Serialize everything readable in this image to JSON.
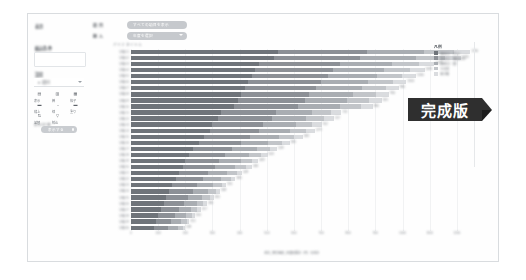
{
  "app": {
    "badge": "完成版"
  },
  "sidebar": {
    "labels": [
      "表示",
      "絞込条件",
      "設定"
    ],
    "select": {
      "value": "▾ 項目",
      "caret": "chevron-down-icon"
    },
    "icon_buttons": [
      {
        "name": "table-view-icon",
        "glyph": "▤",
        "caption": "表示"
      },
      {
        "name": "bar-chart-icon",
        "glyph": "▥",
        "caption": "棒"
      },
      {
        "name": "grid-icon",
        "glyph": "▦",
        "caption": "格子"
      },
      {
        "name": "stack-icon",
        "glyph": "▬",
        "caption": "積上"
      },
      {
        "name": "line-icon",
        "glyph": "⎯",
        "caption": "線"
      },
      {
        "name": "fill-icon",
        "glyph": "▬",
        "caption": "塗り"
      },
      {
        "name": "sort-asc-icon",
        "glyph": "⇅",
        "caption": "並替"
      },
      {
        "name": "filter-icon",
        "glyph": "▽",
        "caption": "絞込"
      }
    ],
    "switch_label": "表示切替",
    "switch_caption": "ラベル",
    "pill": {
      "label": "表示する",
      "toggle": "toggle-knob"
    }
  },
  "top_filters": [
    {
      "label": "項 目",
      "value": "すべての項目を表示",
      "caret": false
    },
    {
      "label": "期 入",
      "value": "年度を選択",
      "caret": true
    }
  ],
  "legend": {
    "title": "凡例",
    "items": [
      {
        "label": "第1区分（売上）",
        "color": "#6f747a"
      },
      {
        "label": "第2区分（構成比率）",
        "color": "#8c9096"
      },
      {
        "label": "第3区分（差）",
        "color": "#a9adb2"
      },
      {
        "label": "その他",
        "color": "#c2c5c9"
      },
      {
        "label": "未分類",
        "color": "#dadcdf"
      }
    ]
  },
  "chart_data": {
    "type": "bar",
    "orientation": "horizontal",
    "stacked": true,
    "title": "",
    "header_note": "グラフタイトル",
    "xlabel": "合計_取引金額_年度別累計（円）の合計",
    "ylabel": "",
    "xlim": [
      0,
      1300
    ],
    "xticks": [
      0,
      100,
      200,
      300,
      400,
      500,
      600,
      700,
      800,
      900,
      1000,
      1100,
      1200
    ],
    "grid": true,
    "legend_position": "right",
    "categories": [
      "分類 01",
      "分類 02",
      "分類 03",
      "分類 04",
      "分類 05",
      "分類 06",
      "分類 07",
      "分類 08",
      "分類 09",
      "分類 10",
      "分類 11",
      "分類 12",
      "分類 13",
      "分類 14",
      "分類 15",
      "分類 16",
      "分類 17",
      "分類 18",
      "分類 19",
      "分類 20",
      "分類 21",
      "分類 22",
      "分類 23",
      "分類 24",
      "分類 25",
      "分類 26",
      "分類 27",
      "分類 28",
      "分類 29",
      "分類 30"
    ],
    "series": [
      {
        "name": "第1区分（売上）",
        "color": "#6f747a",
        "values": [
          540,
          525,
          470,
          455,
          445,
          430,
          420,
          405,
          395,
          380,
          330,
          320,
          300,
          290,
          270,
          250,
          230,
          215,
          200,
          190,
          175,
          165,
          150,
          140,
          130,
          120,
          110,
          100,
          92,
          85
        ]
      },
      {
        "name": "第2区分（構成比率）",
        "color": "#8c9096",
        "values": [
          330,
          320,
          300,
          290,
          280,
          270,
          262,
          252,
          244,
          236,
          205,
          198,
          186,
          180,
          168,
          155,
          143,
          133,
          124,
          118,
          108,
          102,
          93,
          87,
          81,
          74,
          68,
          62,
          57,
          53
        ]
      },
      {
        "name": "第3区分（差）",
        "color": "#a9adb2",
        "values": [
          210,
          205,
          192,
          186,
          180,
          174,
          168,
          162,
          157,
          152,
          132,
          127,
          120,
          116,
          108,
          100,
          92,
          86,
          80,
          76,
          70,
          66,
          60,
          56,
          52,
          48,
          44,
          40,
          37,
          34
        ]
      },
      {
        "name": "その他",
        "color": "#c2c5c9",
        "values": [
          110,
          107,
          100,
          97,
          94,
          91,
          88,
          85,
          82,
          79,
          69,
          66,
          62,
          60,
          56,
          52,
          48,
          45,
          42,
          40,
          36,
          34,
          31,
          29,
          27,
          25,
          23,
          21,
          19,
          18
        ]
      },
      {
        "name": "未分類",
        "color": "#dadcdf",
        "values": [
          60,
          58,
          55,
          53,
          51,
          49,
          48,
          46,
          45,
          43,
          38,
          36,
          34,
          33,
          31,
          28,
          26,
          24,
          23,
          22,
          20,
          18,
          17,
          16,
          15,
          13,
          12,
          11,
          10,
          9
        ]
      }
    ],
    "totals": [
      1250,
      1215,
      1117,
      1081,
      1050,
      1014,
      986,
      950,
      923,
      890,
      774,
      747,
      702,
      679,
      633,
      585,
      539,
      503,
      469,
      446,
      409,
      385,
      351,
      328,
      305,
      280,
      257,
      234,
      215,
      199
    ]
  }
}
